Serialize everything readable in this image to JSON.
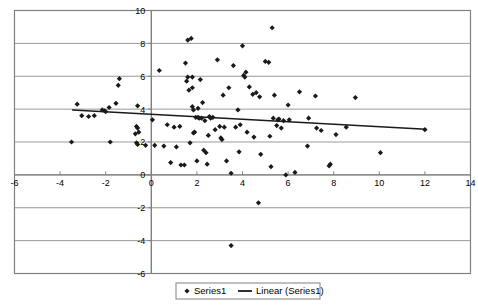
{
  "chart_data": {
    "type": "scatter",
    "title": "",
    "xlabel": "",
    "ylabel": "",
    "xlim": [
      -6,
      14
    ],
    "ylim": [
      -6,
      10
    ],
    "xticks": [
      -6,
      -4,
      -2,
      0,
      2,
      4,
      6,
      8,
      10,
      12,
      14
    ],
    "yticks": [
      10,
      8,
      6,
      4,
      2,
      0,
      -2,
      -4,
      -6
    ],
    "xtick_labels": [
      "-6",
      "-4",
      "-2",
      "0",
      "2",
      "4",
      "6",
      "8",
      "10",
      "12",
      "14"
    ],
    "ytick_labels": [
      "10",
      "8",
      "6",
      "4",
      "2",
      "0",
      "-2",
      "-4",
      "-6"
    ],
    "grid": true,
    "grid_axis": "y",
    "grid_color": "#999999",
    "plot_border_color": "#808080",
    "axis_color": "#808080",
    "background": "#ffffff",
    "legend_position": "bottom",
    "marker": "diamond",
    "marker_color": "#1a1a1a",
    "marker_size": 2.6,
    "series": [
      {
        "name": "Series1",
        "type": "scatter",
        "points": [
          [
            -3.25,
            4.3
          ],
          [
            -3.5,
            2.0
          ],
          [
            -3.05,
            3.6
          ],
          [
            -2.75,
            3.55
          ],
          [
            -2.5,
            3.6
          ],
          [
            -2.15,
            3.95
          ],
          [
            -2.05,
            3.9
          ],
          [
            -2.0,
            3.85
          ],
          [
            -1.85,
            4.1
          ],
          [
            -1.8,
            2.0
          ],
          [
            -1.55,
            4.35
          ],
          [
            -1.4,
            5.85
          ],
          [
            -1.45,
            5.45
          ],
          [
            -0.6,
            4.2
          ],
          [
            -0.65,
            2.95
          ],
          [
            -0.6,
            2.85
          ],
          [
            -0.7,
            2.5
          ],
          [
            -0.65,
            1.95
          ],
          [
            -0.6,
            1.85
          ],
          [
            -0.55,
            2.6
          ],
          [
            -0.25,
            1.8
          ],
          [
            0.05,
            3.35
          ],
          [
            0.15,
            1.8
          ],
          [
            0.35,
            6.35
          ],
          [
            0.55,
            1.75
          ],
          [
            0.7,
            3.05
          ],
          [
            0.85,
            0.75
          ],
          [
            1.0,
            2.9
          ],
          [
            1.1,
            1.7
          ],
          [
            1.25,
            2.95
          ],
          [
            1.3,
            0.6
          ],
          [
            1.45,
            0.6
          ],
          [
            1.5,
            6.8
          ],
          [
            1.55,
            5.7
          ],
          [
            1.6,
            5.95
          ],
          [
            1.6,
            8.2
          ],
          [
            1.65,
            5.15
          ],
          [
            1.7,
            1.95
          ],
          [
            1.75,
            8.3
          ],
          [
            1.8,
            5.95
          ],
          [
            1.8,
            5.3
          ],
          [
            1.8,
            4.15
          ],
          [
            1.85,
            2.55
          ],
          [
            1.85,
            3.95
          ],
          [
            1.9,
            2.6
          ],
          [
            1.95,
            3.5
          ],
          [
            2.0,
            0.85
          ],
          [
            2.05,
            4.05
          ],
          [
            2.05,
            3.5
          ],
          [
            2.1,
            3.45
          ],
          [
            2.15,
            5.8
          ],
          [
            2.2,
            3.45
          ],
          [
            2.25,
            4.4
          ],
          [
            2.3,
            1.5
          ],
          [
            2.35,
            3.3
          ],
          [
            2.4,
            1.35
          ],
          [
            2.45,
            0.65
          ],
          [
            2.5,
            2.4
          ],
          [
            2.55,
            3.55
          ],
          [
            2.6,
            3.45
          ],
          [
            2.7,
            3.5
          ],
          [
            2.8,
            2.75
          ],
          [
            2.9,
            7.0
          ],
          [
            3.0,
            2.95
          ],
          [
            3.05,
            2.25
          ],
          [
            3.1,
            2.15
          ],
          [
            3.15,
            4.85
          ],
          [
            3.2,
            2.9
          ],
          [
            3.3,
            0.85
          ],
          [
            3.4,
            5.3
          ],
          [
            3.5,
            0.1
          ],
          [
            3.5,
            -4.3
          ],
          [
            3.6,
            6.65
          ],
          [
            3.7,
            2.9
          ],
          [
            3.8,
            3.95
          ],
          [
            3.85,
            1.4
          ],
          [
            3.9,
            3.05
          ],
          [
            4.0,
            7.85
          ],
          [
            4.05,
            6.05
          ],
          [
            4.1,
            5.95
          ],
          [
            4.15,
            6.25
          ],
          [
            4.2,
            2.6
          ],
          [
            4.3,
            5.35
          ],
          [
            4.45,
            4.9
          ],
          [
            4.5,
            2.3
          ],
          [
            4.6,
            5.0
          ],
          [
            4.7,
            -1.7
          ],
          [
            4.75,
            4.75
          ],
          [
            4.8,
            1.25
          ],
          [
            5.0,
            6.9
          ],
          [
            5.15,
            6.85
          ],
          [
            5.2,
            2.35
          ],
          [
            5.25,
            0.5
          ],
          [
            5.3,
            8.95
          ],
          [
            5.35,
            3.45
          ],
          [
            5.4,
            4.85
          ],
          [
            5.5,
            3.0
          ],
          [
            5.55,
            3.35
          ],
          [
            5.6,
            3.4
          ],
          [
            5.7,
            2.85
          ],
          [
            5.8,
            3.3
          ],
          [
            5.9,
            0.0
          ],
          [
            6.0,
            4.25
          ],
          [
            6.05,
            3.35
          ],
          [
            6.3,
            0.15
          ],
          [
            6.5,
            5.05
          ],
          [
            6.85,
            1.75
          ],
          [
            6.9,
            3.45
          ],
          [
            7.2,
            4.8
          ],
          [
            7.25,
            2.85
          ],
          [
            7.45,
            2.7
          ],
          [
            7.8,
            0.55
          ],
          [
            7.85,
            0.65
          ],
          [
            8.1,
            2.45
          ],
          [
            8.55,
            2.9
          ],
          [
            8.95,
            4.7
          ],
          [
            10.05,
            1.35
          ],
          [
            12.0,
            2.75
          ]
        ]
      },
      {
        "name": "Linear (Series1)",
        "type": "line",
        "trendline": true,
        "x_start": -3.45,
        "y_start": 3.95,
        "x_end": 12.05,
        "y_end": 2.78,
        "color": "#1a1a1a"
      }
    ],
    "legend": [
      {
        "label": "Series1",
        "marker": "diamond"
      },
      {
        "label": "Linear (Series1)",
        "marker": "line"
      }
    ]
  }
}
